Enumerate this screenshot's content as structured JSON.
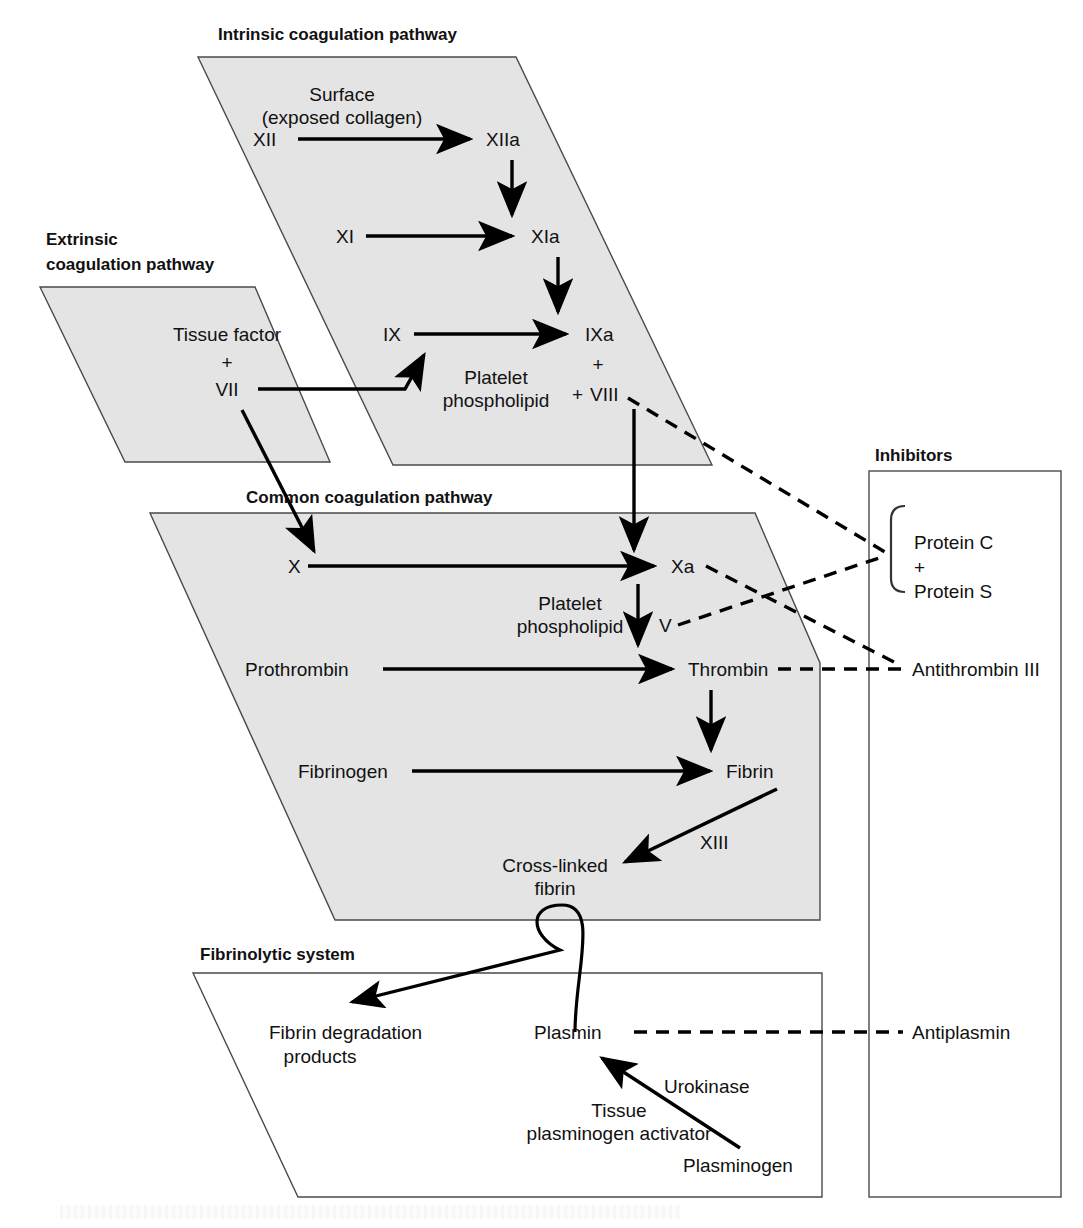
{
  "panels": {
    "intrinsic": {
      "title": "Intrinsic coagulation pathway"
    },
    "extrinsic": {
      "title_line1": "Extrinsic",
      "title_line2": "coagulation pathway"
    },
    "common": {
      "title": "Common coagulation pathway"
    },
    "fibrinolytic": {
      "title": "Fibrinolytic system"
    },
    "inhibitors": {
      "title": "Inhibitors"
    }
  },
  "intrinsic": {
    "surface_line1": "Surface",
    "surface_line2": "(exposed collagen)",
    "factor_xii": "XII",
    "factor_xiia": "XIIa",
    "factor_xi": "XI",
    "factor_xia": "XIa",
    "factor_ix": "IX",
    "factor_ixa": "IXa",
    "plus_1": "+",
    "platelet_line1": "Platelet",
    "platelet_line2": "phospholipid",
    "plus_2": "+",
    "factor_viii": "VIII"
  },
  "extrinsic": {
    "tissue_factor": "Tissue factor",
    "plus": "+",
    "factor_vii": "VII"
  },
  "common": {
    "factor_x": "X",
    "factor_xa": "Xa",
    "platelet_line1": "Platelet",
    "platelet_line2": "phospholipid",
    "factor_v": "V",
    "prothrombin": "Prothrombin",
    "thrombin": "Thrombin",
    "fibrinogen": "Fibrinogen",
    "fibrin": "Fibrin",
    "factor_xiii": "XIII",
    "crosslinked_line1": "Cross-linked",
    "crosslinked_line2": "fibrin"
  },
  "fibrinolytic": {
    "fdp_line1": "Fibrin degradation",
    "fdp_line2": "products",
    "plasmin": "Plasmin",
    "urokinase": "Urokinase",
    "tpa_line1": "Tissue",
    "tpa_line2": "plasminogen activator",
    "plasminogen": "Plasminogen"
  },
  "inhibitors": {
    "protein_c": "Protein C",
    "plus": "+",
    "protein_s": "Protein S",
    "antithrombin": "Antithrombin III",
    "antiplasmin": "Antiplasmin"
  },
  "colors": {
    "panel_fill": "#e4e4e4",
    "panel_stroke": "#4a4a4a",
    "ink": "#111111",
    "background": "#ffffff"
  }
}
